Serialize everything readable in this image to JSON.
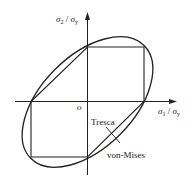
{
  "diagram": {
    "axes": {
      "x_label": {
        "sigma": "σ",
        "sub1": "1",
        "slash": " / ",
        "sigma2": "σ",
        "sub2": "y"
      },
      "y_label": {
        "sigma": "σ",
        "sub1": "2",
        "slash": " / ",
        "sigma2": "σ",
        "sub2": "y"
      },
      "origin_label": "o"
    },
    "curves": [
      {
        "name": "Tresca",
        "shape": "hexagon",
        "label": "Tresca"
      },
      {
        "name": "von-Mises",
        "shape": "ellipse",
        "label": "von-Mises"
      }
    ],
    "colors": {
      "stroke": "#222222",
      "background": "#ffffff"
    }
  }
}
